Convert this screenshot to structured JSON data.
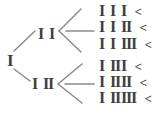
{
  "figure": {
    "background_color": "#ffffff",
    "text_color": "#3f3f3f",
    "line_color": "#8a8a8a",
    "root": {
      "label": "I"
    },
    "nodes": [
      {
        "p0": "I",
        "p1": "I"
      },
      {
        "p0": "I",
        "p1": "II"
      }
    ],
    "leaves": [
      {
        "p0": "I",
        "p1": "I",
        "p2": "I",
        "marker": "<"
      },
      {
        "p0": "I",
        "p1": "I",
        "p2": "II",
        "marker": "<"
      },
      {
        "p0": "I",
        "p1": "I",
        "p2": "III",
        "marker": "<"
      },
      {
        "p0": "I",
        "p1": "II",
        "p2": "I",
        "marker": "<"
      },
      {
        "p0": "I",
        "p1": "II",
        "p2": "II",
        "marker": "<"
      },
      {
        "p0": "I",
        "p1": "II",
        "p2": "III",
        "marker": "<"
      }
    ]
  }
}
